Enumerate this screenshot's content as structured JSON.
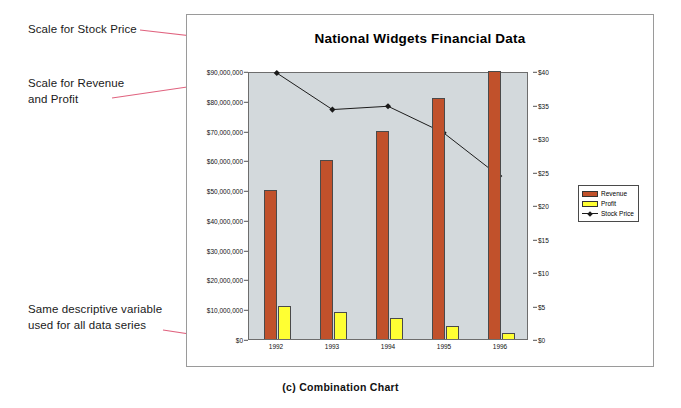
{
  "figure": {
    "caption": "(c) Combination Chart"
  },
  "annotations": [
    {
      "id": "stock-scale",
      "text": "Scale for Stock Price"
    },
    {
      "id": "revenue-profit-scale",
      "text": "Scale for Revenue\nand Profit"
    },
    {
      "id": "same-variable",
      "text": "Same descriptive variable\nused for all data series"
    }
  ],
  "colors": {
    "revenue": "#c1512b",
    "profit": "#ffff33",
    "stock_price": "#1a1a1a",
    "plot_background": "#d3d9dc",
    "frame_border": "#9a9a9a",
    "annotation_leader": "#e0637f"
  },
  "chart_data": {
    "type": "bar",
    "title": "National Widgets Financial Data",
    "xlabel": "",
    "ylabel": "",
    "categories": [
      "1992",
      "1993",
      "1994",
      "1995",
      "1996"
    ],
    "grid": false,
    "legend_position": "right",
    "series": [
      {
        "name": "Revenue",
        "type": "bar",
        "axis": "left",
        "values": [
          50000000,
          60000000,
          70000000,
          81000000,
          90000000
        ]
      },
      {
        "name": "Profit",
        "type": "bar",
        "axis": "left",
        "values": [
          11000000,
          9000000,
          7000000,
          4500000,
          2000000
        ]
      },
      {
        "name": "Stock Price",
        "type": "line",
        "axis": "right",
        "values": [
          40,
          34.5,
          35,
          31,
          24.5
        ]
      }
    ],
    "axes": {
      "left": {
        "label": "",
        "min": 0,
        "max": 90000000,
        "step": 10000000,
        "ticks": [
          "$0",
          "$10,000,000",
          "$20,000,000",
          "$30,000,000",
          "$40,000,000",
          "$50,000,000",
          "$60,000,000",
          "$70,000,000",
          "$80,000,000",
          "$90,000,000"
        ]
      },
      "right": {
        "label": "",
        "min": 0,
        "max": 40,
        "step": 5,
        "ticks": [
          "$0",
          "$5",
          "$10",
          "$15",
          "$20",
          "$25",
          "$30",
          "$35",
          "$40"
        ]
      }
    }
  }
}
